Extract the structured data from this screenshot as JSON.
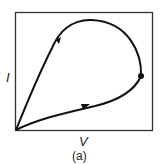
{
  "figure": {
    "x_axis_label": "V",
    "y_axis_label": "I",
    "caption": "(a)",
    "line_color": "#111111",
    "frame_color": "#333333"
  },
  "diagram": {
    "type": "I-V hysteresis loop",
    "elements": [
      {
        "name": "frame",
        "kind": "rectangle"
      },
      {
        "name": "lower-branch",
        "kind": "curve",
        "from": "origin",
        "to": "turning-point",
        "arrow": "right"
      },
      {
        "name": "upper-branch",
        "kind": "curve",
        "from": "turning-point",
        "to": "origin",
        "arrow": "down-left",
        "via": "top-of-loop"
      },
      {
        "name": "turning-point",
        "kind": "dot"
      }
    ]
  }
}
